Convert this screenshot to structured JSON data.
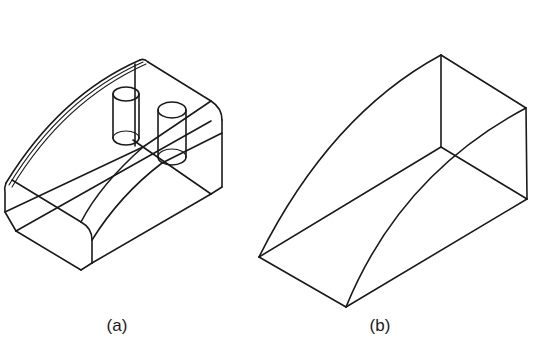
{
  "figure": {
    "panels": [
      {
        "id": "a",
        "label": "(a)",
        "description": "Isometric wireframe of a block with rounded front edges, a curved swept top surface, and two vertical cylinders (holes/bosses)",
        "features": [
          "rounded-edge block",
          "curved sweep surface",
          "cylinder-1",
          "cylinder-2"
        ]
      },
      {
        "id": "b",
        "label": "(b)",
        "description": "Isometric wireframe of the simplified wedge-like swept volume with curved edges",
        "features": [
          "wedge volume",
          "curved edges"
        ]
      }
    ],
    "line_color": "#1a1a1a",
    "background_color": "#ffffff"
  }
}
